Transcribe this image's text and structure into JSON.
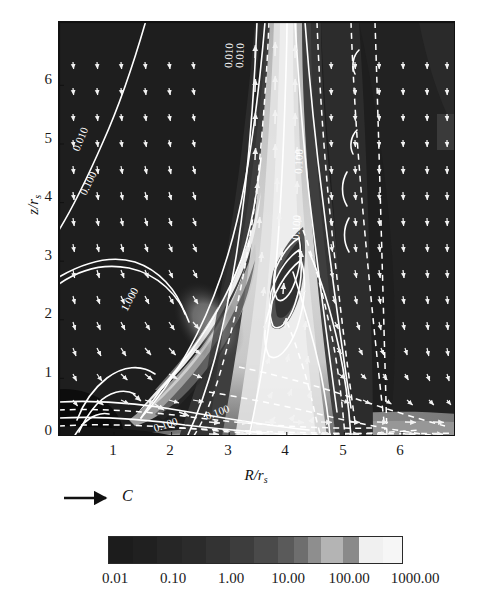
{
  "figure": {
    "kind": "contour-plot-with-vectors",
    "background": "#ffffff"
  },
  "axes": {
    "x": {
      "label_num": "R",
      "label_den": "r",
      "label_den_sub": "s",
      "ticks": [
        "1",
        "2",
        "3",
        "4",
        "5",
        "6"
      ],
      "tick_values": [
        1,
        2,
        3,
        4,
        5,
        6
      ],
      "range": [
        0.0,
        6.95
      ]
    },
    "y": {
      "label_num": "z",
      "label_den": "r",
      "label_den_sub": "s",
      "ticks": [
        "0",
        "1",
        "2",
        "3",
        "4",
        "5",
        "6"
      ],
      "tick_values": [
        0,
        1,
        2,
        3,
        4,
        5,
        6
      ],
      "range": [
        0.0,
        7.15
      ]
    }
  },
  "velocity_key": {
    "label": "C",
    "arrow": "right-arrow"
  },
  "colorbar": {
    "labels": [
      "0.01",
      "0.10",
      "1.00",
      "10.00",
      "100.00",
      "1000.00"
    ],
    "values": [
      0.01,
      0.1,
      1.0,
      10.0,
      100.0,
      1000.0
    ],
    "scale": "log",
    "segments": [
      "#1c1c1c",
      "#202020",
      "#262626",
      "#2b2b2b",
      "#333333",
      "#3d3d3d",
      "#4a4a4a",
      "#5a5a5a",
      "#6e6e6e",
      "#8e8e8e",
      "#b4b4b4",
      "#8a8a8a",
      "#f0f0f0",
      "#f6f6f6"
    ],
    "seg_widths": [
      9,
      9,
      9,
      9,
      9,
      9,
      9,
      6,
      5,
      5,
      8,
      6,
      9,
      7
    ]
  },
  "contours": {
    "levels": [
      "0.010",
      "0.100",
      "1.000"
    ],
    "inline_labels": [
      {
        "text": "0.010",
        "x": 20,
        "y": 130,
        "rot": -68
      },
      {
        "text": "0.100",
        "x": 27,
        "y": 172,
        "rot": -64
      },
      {
        "text": "0.010",
        "x": 175,
        "y": 45,
        "rot": -88
      },
      {
        "text": "0.010",
        "x": 183,
        "y": 44,
        "rot": -88
      },
      {
        "text": "1.000",
        "x": 68,
        "y": 288,
        "rot": -62
      },
      {
        "text": "0.100",
        "x": 243,
        "y": 150,
        "rot": -88
      },
      {
        "text": "0.100",
        "x": 240,
        "y": 218,
        "rot": -86
      },
      {
        "text": "0.100",
        "x": 150,
        "y": 397,
        "rot": -22
      },
      {
        "text": "0.100",
        "x": 100,
        "y": 410,
        "rot": -20
      }
    ]
  },
  "chart_data": {
    "type": "heatmap",
    "title": "",
    "xlabel": "R/r_s",
    "ylabel": "z/r_s",
    "xlim": [
      0,
      6.95
    ],
    "ylim": [
      0,
      7.15
    ],
    "grid": false,
    "legend_position": "below",
    "colorbar_scale": "log",
    "colorbar_ticks": [
      0.01,
      0.1,
      1.0,
      10.0,
      100.0,
      1000.0
    ],
    "contour_levels": [
      0.01,
      0.1,
      1.0
    ],
    "vector_field": {
      "grid_nx": 24,
      "grid_ny": 25,
      "scale_label": "C"
    }
  }
}
